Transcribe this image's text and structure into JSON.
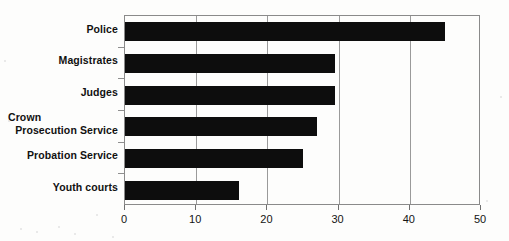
{
  "chart_data": {
    "type": "bar",
    "orientation": "horizontal",
    "title": "",
    "xlabel": "",
    "ylabel": "",
    "xlim": [
      0,
      50
    ],
    "xticks": [
      0,
      10,
      20,
      30,
      40,
      50
    ],
    "xtick_labels": [
      "0",
      "10",
      "20",
      "30",
      "40",
      "50"
    ],
    "grid": true,
    "legend": false,
    "bar_color": "#0d0d0d",
    "categories": [
      "Police",
      "Magistrates",
      "Judges",
      "Crown Prosecution Service",
      "Probation Service",
      "Youth courts"
    ],
    "values": [
      45,
      29.5,
      29.5,
      27,
      25,
      16
    ],
    "category_labels": [
      {
        "lines": [
          "Police"
        ],
        "align": [
          "right"
        ]
      },
      {
        "lines": [
          "Magistrates"
        ],
        "align": [
          "right"
        ]
      },
      {
        "lines": [
          "Judges"
        ],
        "align": [
          "right"
        ]
      },
      {
        "lines": [
          "Crown",
          "Prosecution Service"
        ],
        "align": [
          "left",
          "right"
        ]
      },
      {
        "lines": [
          "Probation Service"
        ],
        "align": [
          "right"
        ]
      },
      {
        "lines": [
          "Youth courts"
        ],
        "align": [
          "right"
        ]
      }
    ]
  }
}
